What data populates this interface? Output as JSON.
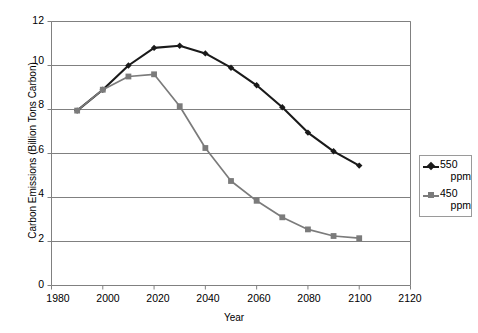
{
  "chart_data": {
    "type": "line",
    "title": "",
    "xlabel": "Year",
    "ylabel": "Carbon Emissions (Billion Tons Carbon)",
    "xlim": [
      1980,
      2120
    ],
    "ylim": [
      0,
      12
    ],
    "xticks": [
      1980,
      2000,
      2020,
      2040,
      2060,
      2080,
      2100,
      2120
    ],
    "yticks": [
      0,
      2,
      4,
      6,
      8,
      10,
      12
    ],
    "grid": "horizontal",
    "legend_position": "right",
    "series": [
      {
        "name": "550 ppm",
        "label_line1": "550",
        "label_line2": "ppm",
        "color": "#1a1a1a",
        "marker": "diamond",
        "x": [
          1990,
          2000,
          2010,
          2020,
          2030,
          2040,
          2050,
          2060,
          2070,
          2080,
          2090,
          2100
        ],
        "values": [
          7.95,
          8.9,
          10.0,
          10.8,
          10.9,
          10.55,
          9.9,
          9.1,
          8.1,
          6.95,
          6.1,
          5.45
        ]
      },
      {
        "name": "450 ppm",
        "label_line1": "450",
        "label_line2": "ppm",
        "color": "#7b7b7b",
        "marker": "square",
        "x": [
          1990,
          2000,
          2010,
          2020,
          2030,
          2040,
          2050,
          2060,
          2070,
          2080,
          2090,
          2100
        ],
        "values": [
          7.95,
          8.9,
          9.5,
          9.6,
          8.15,
          6.25,
          4.75,
          3.85,
          3.1,
          2.55,
          2.25,
          2.15
        ]
      }
    ]
  },
  "axis": {
    "y_title": "Carbon Emissions (Billion Tons Carbon)",
    "x_title": "Year",
    "y_tick_labels": [
      "12",
      "10",
      "8",
      "6",
      "4",
      "2",
      "0"
    ],
    "x_tick_labels": [
      "1980",
      "2000",
      "2020",
      "2040",
      "2060",
      "2080",
      "2100",
      "2120"
    ]
  },
  "legend": {
    "items": [
      {
        "line1": "550",
        "line2": "ppm",
        "color": "#1a1a1a",
        "marker": "diamond"
      },
      {
        "line1": "450",
        "line2": "ppm",
        "color": "#7b7b7b",
        "marker": "square"
      }
    ]
  }
}
